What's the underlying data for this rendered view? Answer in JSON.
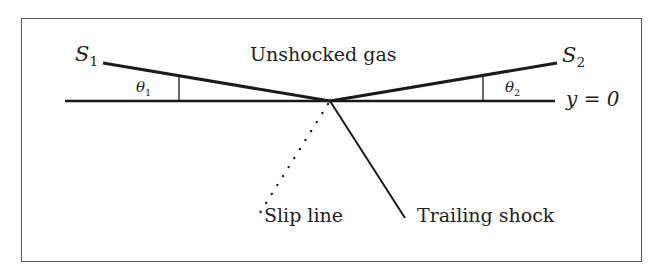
{
  "labels": {
    "s1": "S",
    "s1_sub": "1",
    "s2": "S",
    "s2_sub": "2",
    "theta1": "θ",
    "theta1_sub": "1",
    "theta2": "θ",
    "theta2_sub": "2",
    "unshocked": "Unshocked gas",
    "axis": "y = 0",
    "slip": "Slip line",
    "trailing": "Trailing shock"
  },
  "colors": {
    "line": "#1a1a1a",
    "frame": "#555555"
  }
}
